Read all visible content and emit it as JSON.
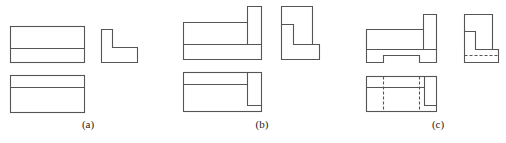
{
  "figure": {
    "panels": [
      {
        "id": "a",
        "label": "(a)",
        "label_x": 88
      },
      {
        "id": "b",
        "label": "(b)",
        "label_x": 262
      },
      {
        "id": "c",
        "label": "(c)",
        "label_x": 438
      }
    ],
    "colors": {
      "line": "#555555",
      "background": "#ffffff"
    }
  }
}
